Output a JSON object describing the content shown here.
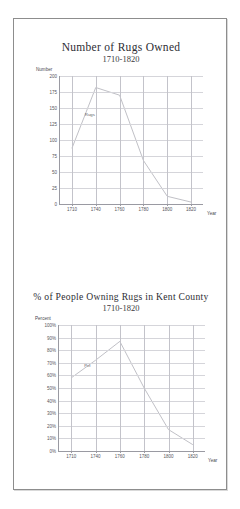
{
  "document": {
    "background_color": "#ffffff",
    "sheet_border_color": "#8d8d8d"
  },
  "chart_data": [
    {
      "id": "rugs-owned",
      "type": "line",
      "title": "Number of Rugs Owned",
      "subtitle": "1710-1820",
      "xlabel": "Year",
      "ylabel": "Number",
      "x": [
        1710,
        1740,
        1760,
        1780,
        1800,
        1820
      ],
      "xticklabels": [
        "1710",
        "1740",
        "1760",
        "1780",
        "1800",
        "1820"
      ],
      "yticklabels": [
        "0",
        "25",
        "50",
        "75",
        "100",
        "125",
        "150",
        "175",
        "200"
      ],
      "ylim": [
        0,
        200
      ],
      "ytick_step": 25,
      "grid": true,
      "legend_position": "inline",
      "series": [
        {
          "name": "Rugs",
          "color": "#b9b9bf",
          "values": [
            87,
            182,
            170,
            68,
            12,
            3
          ]
        }
      ]
    },
    {
      "id": "pct-people-owning-rugs",
      "type": "line",
      "title": "% of People Owning Rugs in Kent County",
      "subtitle": "1710-1820",
      "xlabel": "Year",
      "ylabel": "Percent",
      "x": [
        1710,
        1740,
        1760,
        1780,
        1800,
        1820
      ],
      "xticklabels": [
        "1710",
        "1740",
        "1760",
        "1780",
        "1800",
        "1820"
      ],
      "yticklabels": [
        "0%",
        "10%",
        "20%",
        "30%",
        "40%",
        "50%",
        "60%",
        "70%",
        "80%",
        "90%",
        "100%"
      ],
      "ylim": [
        0,
        100
      ],
      "ytick_step": 10,
      "grid": true,
      "legend_position": "inline",
      "series": [
        {
          "name": "Pct",
          "color": "#b9b9bf",
          "values": [
            58,
            72,
            87,
            50,
            17,
            5
          ]
        }
      ]
    }
  ]
}
